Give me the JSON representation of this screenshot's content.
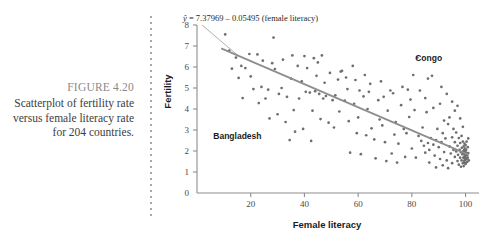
{
  "figure": {
    "number_label": "FIGURE 4.20",
    "caption_lines": [
      "Scatterplot of fertility rate",
      "versus female literacy rate",
      "for 204 countries."
    ]
  },
  "colors": {
    "point": "#6e6e6e",
    "regression_line": "#8e8e8e",
    "axis": "#8d8d8d",
    "caption_number": "#8a8a8a",
    "caption_text": "#3d3d3d",
    "divider": "#a9a9a9"
  },
  "chart_data": {
    "type": "scatter",
    "title": "",
    "xlabel": "Female literacy",
    "ylabel": "Fertility",
    "xlim": [
      0,
      105
    ],
    "ylim": [
      0,
      8
    ],
    "xticks": [
      20,
      40,
      60,
      80,
      100
    ],
    "yticks": [
      0,
      1,
      2,
      3,
      4,
      5,
      6,
      7,
      8
    ],
    "grid": false,
    "legend": "none",
    "n_points_stated": 204,
    "equation": {
      "text": "ŷ = 7.37969 − 0.05495 (female literacy)",
      "yhat": "ŷ",
      "intercept": 7.37969,
      "slope": -0.05495,
      "predictor": "female literacy"
    },
    "fit_line": {
      "x": [
        9,
        101
      ],
      "y": [
        6.885,
        1.829
      ]
    },
    "annotations": [
      {
        "label": "Congo",
        "x": 82,
        "y": 6.45
      },
      {
        "label": "Bangladesh",
        "x": 27,
        "y": 2.72
      }
    ],
    "points": [
      [
        10.5,
        7.55
      ],
      [
        12.0,
        6.78
      ],
      [
        14.5,
        6.45
      ],
      [
        16.5,
        6.05
      ],
      [
        19.5,
        6.62
      ],
      [
        20.0,
        5.55
      ],
      [
        22.5,
        6.6
      ],
      [
        24.0,
        5.05
      ],
      [
        25.5,
        4.5
      ],
      [
        27.0,
        3.55
      ],
      [
        28.5,
        7.4
      ],
      [
        29.0,
        5.9
      ],
      [
        30.5,
        4.72
      ],
      [
        31.5,
        5.0
      ],
      [
        32.0,
        6.35
      ],
      [
        33.5,
        4.58
      ],
      [
        34.5,
        2.52
      ],
      [
        35.5,
        6.55
      ],
      [
        36.0,
        3.95
      ],
      [
        37.5,
        6.05
      ],
      [
        38.0,
        4.5
      ],
      [
        39.0,
        5.32
      ],
      [
        40.5,
        4.82
      ],
      [
        41.0,
        5.95
      ],
      [
        42.0,
        4.78
      ],
      [
        42.5,
        2.48
      ],
      [
        43.5,
        6.42
      ],
      [
        44.0,
        4.85
      ],
      [
        45.0,
        6.22
      ],
      [
        45.5,
        4.72
      ],
      [
        46.5,
        6.55
      ],
      [
        47.0,
        4.5
      ],
      [
        48.0,
        4.62
      ],
      [
        49.5,
        5.72
      ],
      [
        50.5,
        4.42
      ],
      [
        51.0,
        3.12
      ],
      [
        52.5,
        5.4
      ],
      [
        53.5,
        5.78
      ],
      [
        54.0,
        5.82
      ],
      [
        55.0,
        4.4
      ],
      [
        56.0,
        4.95
      ],
      [
        57.0,
        1.92
      ],
      [
        58.5,
        4.25
      ],
      [
        59.0,
        5.38
      ],
      [
        60.0,
        3.6
      ],
      [
        61.0,
        1.85
      ],
      [
        62.0,
        4.6
      ],
      [
        63.5,
        4.0
      ],
      [
        64.5,
        5.2
      ],
      [
        65.0,
        3.08
      ],
      [
        66.0,
        2.55
      ],
      [
        67.5,
        4.42
      ],
      [
        68.0,
        3.5
      ],
      [
        69.5,
        4.58
      ],
      [
        70.0,
        2.42
      ],
      [
        71.0,
        3.92
      ],
      [
        72.5,
        1.88
      ],
      [
        73.0,
        4.75
      ],
      [
        74.0,
        3.38
      ],
      [
        75.0,
        2.35
      ],
      [
        76.0,
        4.18
      ],
      [
        77.0,
        3.05
      ],
      [
        78.5,
        4.92
      ],
      [
        79.0,
        3.62
      ],
      [
        80.0,
        2.12
      ],
      [
        81.0,
        3.95
      ],
      [
        82.0,
        6.45
      ],
      [
        82.5,
        2.72
      ],
      [
        83.5,
        2.48
      ],
      [
        84.0,
        3.12
      ],
      [
        84.5,
        2.25
      ],
      [
        85.0,
        4.52
      ],
      [
        85.5,
        3.85
      ],
      [
        86.0,
        2.38
      ],
      [
        86.5,
        2.05
      ],
      [
        87.0,
        2.62
      ],
      [
        87.5,
        5.58
      ],
      [
        88.0,
        2.3
      ],
      [
        88.5,
        1.78
      ],
      [
        89.0,
        2.52
      ],
      [
        89.5,
        3.05
      ],
      [
        90.0,
        2.18
      ],
      [
        90.5,
        1.62
      ],
      [
        91.0,
        2.42
      ],
      [
        91.5,
        2.85
      ],
      [
        92.0,
        1.95
      ],
      [
        92.5,
        2.6
      ],
      [
        93.0,
        1.55
      ],
      [
        93.5,
        3.28
      ],
      [
        94.0,
        2.22
      ],
      [
        94.5,
        1.88
      ],
      [
        95.0,
        2.65
      ],
      [
        95.0,
        1.42
      ],
      [
        95.5,
        2.05
      ],
      [
        95.5,
        3.05
      ],
      [
        96.0,
        1.72
      ],
      [
        96.0,
        2.42
      ],
      [
        96.5,
        1.98
      ],
      [
        96.5,
        2.88
      ],
      [
        97.0,
        1.52
      ],
      [
        97.0,
        2.25
      ],
      [
        97.2,
        1.82
      ],
      [
        97.5,
        2.62
      ],
      [
        97.5,
        1.35
      ],
      [
        97.8,
        2.05
      ],
      [
        98.0,
        1.68
      ],
      [
        98.0,
        2.38
      ],
      [
        98.2,
        1.95
      ],
      [
        98.3,
        1.25
      ],
      [
        98.5,
        2.72
      ],
      [
        98.5,
        1.55
      ],
      [
        98.6,
        2.15
      ],
      [
        98.8,
        1.85
      ],
      [
        99.0,
        1.42
      ],
      [
        99.0,
        2.45
      ],
      [
        99.1,
        1.98
      ],
      [
        99.2,
        1.68
      ],
      [
        99.3,
        2.22
      ],
      [
        99.3,
        1.28
      ],
      [
        99.4,
        1.88
      ],
      [
        99.5,
        2.05
      ],
      [
        99.5,
        1.52
      ],
      [
        99.6,
        1.75
      ],
      [
        99.6,
        2.35
      ],
      [
        99.7,
        1.62
      ],
      [
        99.7,
        1.95
      ],
      [
        99.8,
        1.42
      ],
      [
        99.8,
        2.12
      ],
      [
        99.9,
        1.82
      ],
      [
        99.9,
        1.58
      ],
      [
        100.0,
        2.28
      ],
      [
        100.0,
        1.7
      ],
      [
        100.0,
        1.38
      ],
      [
        100.2,
        1.92
      ],
      [
        100.2,
        2.05
      ],
      [
        100.4,
        1.62
      ],
      [
        100.4,
        2.45
      ],
      [
        100.6,
        1.8
      ],
      [
        100.6,
        1.48
      ],
      [
        100.8,
        2.18
      ],
      [
        100.8,
        1.68
      ],
      [
        101.0,
        1.9
      ],
      [
        101.0,
        2.6
      ],
      [
        101.2,
        1.55
      ],
      [
        94.0,
        3.6
      ],
      [
        92.0,
        3.45
      ],
      [
        90.5,
        4.25
      ],
      [
        88.0,
        4.05
      ],
      [
        93.0,
        4.72
      ],
      [
        91.0,
        5.05
      ],
      [
        86.0,
        5.45
      ],
      [
        80.5,
        5.62
      ],
      [
        78.0,
        2.85
      ],
      [
        74.5,
        1.45
      ],
      [
        70.5,
        1.52
      ],
      [
        66.5,
        1.65
      ],
      [
        63.0,
        2.75
      ],
      [
        59.5,
        2.85
      ],
      [
        56.5,
        3.42
      ],
      [
        53.0,
        3.88
      ],
      [
        49.0,
        3.35
      ],
      [
        46.0,
        3.52
      ],
      [
        43.0,
        3.92
      ],
      [
        39.5,
        3.05
      ],
      [
        36.5,
        2.92
      ],
      [
        33.0,
        3.38
      ],
      [
        30.0,
        3.75
      ],
      [
        26.5,
        4.92
      ],
      [
        23.0,
        4.28
      ],
      [
        21.0,
        4.95
      ],
      [
        18.0,
        5.95
      ],
      [
        15.5,
        5.48
      ],
      [
        13.0,
        5.92
      ],
      [
        47.5,
        5.25
      ],
      [
        51.5,
        4.65
      ],
      [
        55.5,
        5.5
      ],
      [
        60.5,
        4.88
      ],
      [
        64.0,
        4.82
      ],
      [
        68.5,
        5.32
      ],
      [
        72.0,
        4.88
      ],
      [
        76.5,
        5.05
      ],
      [
        79.5,
        4.45
      ],
      [
        83.0,
        4.88
      ],
      [
        85.0,
        1.92
      ],
      [
        81.5,
        1.68
      ],
      [
        77.5,
        1.72
      ],
      [
        73.5,
        2.78
      ],
      [
        69.0,
        3.22
      ],
      [
        62.5,
        5.62
      ],
      [
        58.0,
        6.05
      ],
      [
        44.5,
        5.58
      ],
      [
        40.0,
        6.52
      ],
      [
        35.0,
        5.45
      ],
      [
        28.0,
        6.18
      ],
      [
        24.5,
        6.3
      ],
      [
        17.0,
        4.52
      ],
      [
        98.0,
        3.55
      ],
      [
        96.0,
        3.92
      ],
      [
        99.0,
        3.15
      ],
      [
        97.0,
        4.15
      ],
      [
        95.0,
        4.35
      ],
      [
        93.5,
        1.18
      ],
      [
        91.5,
        1.32
      ],
      [
        89.0,
        1.22
      ],
      [
        86.5,
        1.45
      ]
    ]
  }
}
